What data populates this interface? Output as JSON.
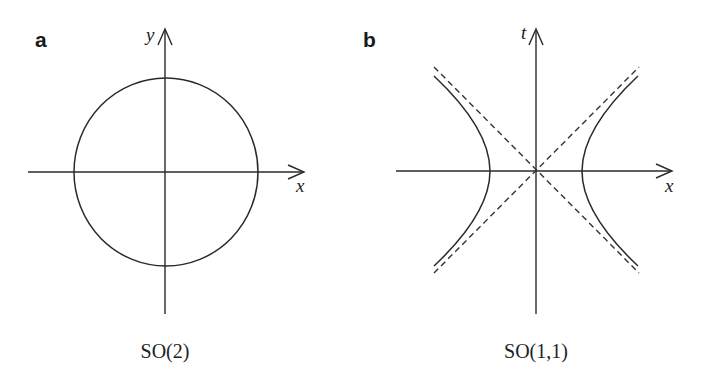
{
  "panels": [
    {
      "label": "a",
      "caption": "SO(2)",
      "x_axis_label": "x",
      "y_axis_label": "y",
      "shape": "circle",
      "description": "Unit circle x^2 + y^2 = 1 centered at origin"
    },
    {
      "label": "b",
      "caption": "SO(1,1)",
      "x_axis_label": "x",
      "y_axis_label": "t",
      "shape": "hyperbola",
      "description": "Hyperbola x^2 - t^2 = 1 with dashed light-cone asymptotes t = ±x"
    }
  ],
  "colors": {
    "ink": "#2a2a2a",
    "background": "#ffffff"
  }
}
